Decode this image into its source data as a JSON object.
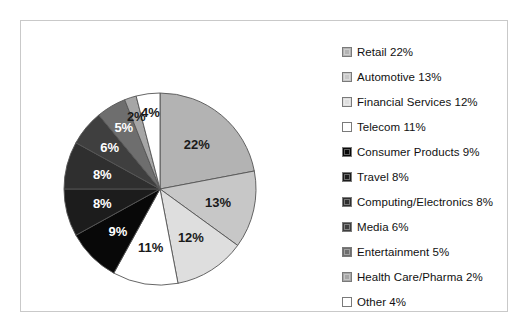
{
  "chart_data": {
    "type": "pie",
    "title": "",
    "legend_position": "right",
    "categories": [
      "Retail",
      "Automotive",
      "Financial Services",
      "Telecom",
      "Consumer Products",
      "Travel",
      "Computing/Electronics",
      "Media",
      "Entertainment",
      "Health Care/Pharma",
      "Other"
    ],
    "values": [
      22,
      13,
      12,
      11,
      9,
      8,
      8,
      6,
      5,
      2,
      4
    ],
    "value_labels": [
      "22%",
      "13%",
      "12%",
      "11%",
      "9%",
      "8%",
      "8%",
      "6%",
      "5%",
      "2%",
      "4%"
    ],
    "units": "percent",
    "total": 100,
    "start_angle_deg": 0,
    "direction": "clockwise",
    "colors": [
      "#b3b3b3",
      "#c7c7c7",
      "#dedede",
      "#ffffff",
      "#080808",
      "#1c1c1c",
      "#2f2f2f",
      "#3f3f3f",
      "#6e6e6e",
      "#a6a6a6",
      "#ffffff"
    ],
    "slice_outline_color": "#555555",
    "slice_label_colors": [
      "#1a1a1a",
      "#1a1a1a",
      "#1a1a1a",
      "#1a1a1a",
      "#ffffff",
      "#ffffff",
      "#ffffff",
      "#ffffff",
      "#ffffff",
      "#1a1a1a",
      "#1a1a1a"
    ],
    "label_radius_factors": [
      0.6,
      0.62,
      0.6,
      0.62,
      0.62,
      0.62,
      0.62,
      0.68,
      0.74,
      0.8,
      0.8
    ],
    "geometry": {
      "cx": 139,
      "cy": 168,
      "r": 96
    }
  },
  "legend": {
    "items": [
      {
        "label": "Retail 22%",
        "swatch": "#b3b3b3"
      },
      {
        "label": "Automotive 13%",
        "swatch": "#c7c7c7"
      },
      {
        "label": "Financial Services 12%",
        "swatch": "#dedede"
      },
      {
        "label": "Telecom 11%",
        "swatch": "#ffffff"
      },
      {
        "label": "Consumer Products 9%",
        "swatch": "#080808"
      },
      {
        "label": "Travel 8%",
        "swatch": "#1c1c1c"
      },
      {
        "label": "Computing/Electronics 8%",
        "swatch": "#2f2f2f"
      },
      {
        "label": "Media 6%",
        "swatch": "#3f3f3f"
      },
      {
        "label": "Entertainment 5%",
        "swatch": "#6e6e6e"
      },
      {
        "label": "Health Care/Pharma 2%",
        "swatch": "#a6a6a6"
      },
      {
        "label": "Other 4%",
        "swatch": "#ffffff"
      }
    ]
  },
  "frame": {
    "border_color": "#c9c9c9",
    "background": "#ffffff"
  }
}
